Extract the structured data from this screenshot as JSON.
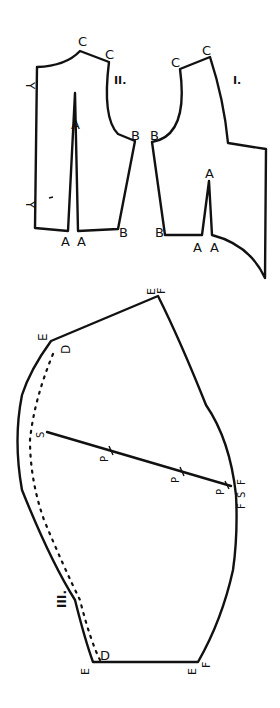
{
  "diagram": {
    "pieces": [
      {
        "id": "II",
        "label": "II.",
        "points": {
          "C1": "C",
          "C2": "C",
          "B1": "B",
          "B2": "B",
          "A_apex": "A",
          "A1": "A",
          "A2": "A",
          "Y1": "Y",
          "Y2": "Y"
        }
      },
      {
        "id": "I",
        "label": "I.",
        "points": {
          "C1": "C",
          "C2": "C",
          "B1": "B",
          "B2": "B",
          "A_apex": "A",
          "A1": "A",
          "A2": "A"
        }
      },
      {
        "id": "III",
        "label": "III.",
        "points": {
          "E_top": "E",
          "F_top": "F",
          "E_left": "E",
          "D_top": "D",
          "S_left": "S",
          "P1": "P",
          "P2": "P",
          "P3": "P",
          "S_right": "S",
          "F_right1": "F",
          "F_right2": "F",
          "F_right3": "F",
          "E_bot_left": "E",
          "D_bot": "D",
          "E_bot_right": "E",
          "F_bot": "F"
        }
      }
    ],
    "colors": {
      "ink": "#111111",
      "paper": "#ffffff"
    }
  }
}
